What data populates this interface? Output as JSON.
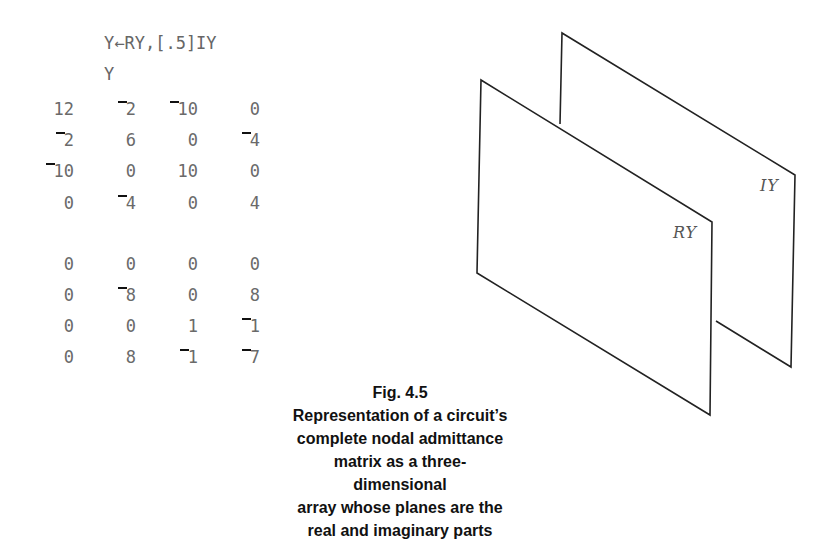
{
  "code": {
    "assignment": "Y←RY,[.5]IY",
    "display": "Y"
  },
  "matrix": {
    "real_plane": [
      [
        "12",
        "¯2",
        "¯10",
        "0"
      ],
      [
        "¯2",
        "6",
        "0",
        "¯4"
      ],
      [
        "¯10",
        "0",
        "10",
        "0"
      ],
      [
        "0",
        "¯4",
        "0",
        "4"
      ]
    ],
    "imag_plane": [
      [
        "0",
        "0",
        "0",
        "0"
      ],
      [
        "0",
        "¯8",
        "0",
        "8"
      ],
      [
        "0",
        "0",
        "1",
        "¯1"
      ],
      [
        "0",
        "8",
        "¯1",
        "¯7"
      ]
    ]
  },
  "diagram": {
    "front_label": "RY",
    "back_label": "IY"
  },
  "caption": {
    "figure": "Fig. 4.5",
    "lines": [
      "Representation of a circuit’s",
      "complete nodal admittance",
      "matrix as a three-dimensional",
      "array whose planes are the",
      "real and imaginary parts"
    ]
  }
}
